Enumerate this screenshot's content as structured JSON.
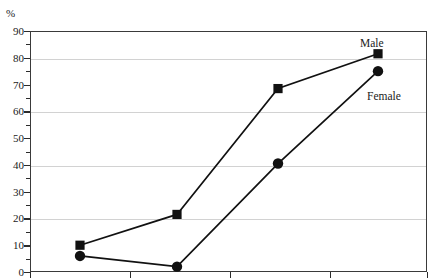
{
  "chart_data": {
    "type": "line",
    "title": "",
    "subtitle": "",
    "xlabel": "",
    "ylabel": "%",
    "ylim": [
      0,
      90
    ],
    "ytick_step": 10,
    "yminor_step": 5,
    "gridlines": [
      20,
      40,
      60,
      80
    ],
    "grid": true,
    "legend_position": "inline-annotation",
    "x_positions": [
      80,
      177,
      278,
      378
    ],
    "x_axis_ticks": [
      30,
      130,
      230,
      330,
      427
    ],
    "x_tick_labels": [],
    "categories": [
      "",
      "",
      "",
      ""
    ],
    "series": [
      {
        "name": "Male",
        "marker": "square",
        "color": "#111111",
        "values": [
          10,
          21.5,
          68.5,
          81.5
        ]
      },
      {
        "name": "Female",
        "marker": "circle",
        "color": "#111111",
        "values": [
          6,
          2,
          40.5,
          75
        ]
      }
    ],
    "annotations": [
      {
        "text": "Male",
        "x": 360,
        "y": 38
      },
      {
        "text": "Female",
        "x": 367,
        "y": 91
      }
    ],
    "ytick_labels": [
      "0",
      "10",
      "20",
      "30",
      "40",
      "50",
      "60",
      "70",
      "80",
      "90"
    ]
  },
  "axis": {
    "unit_label": "%"
  },
  "colors": {
    "line": "#111111",
    "marker": "#111111",
    "grid": "#d2d2d2",
    "frame": "#3a3a3a",
    "background": "#ffffff",
    "text": "#1a1a1a"
  }
}
